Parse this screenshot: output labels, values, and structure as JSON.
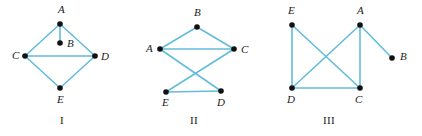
{
  "figure": {
    "background_color": "#ffffff",
    "edge_color": "#63bcdb",
    "vertex_color": "#111111",
    "label_color": "#1a1a1a"
  },
  "graphs": [
    {
      "caption": "I",
      "caption_pos": {
        "x": 62,
        "y": 124
      },
      "vertices": [
        {
          "id": "A",
          "label": "A",
          "x": 60,
          "y": 24,
          "label_x": 58,
          "label_y": 13
        },
        {
          "id": "B",
          "label": "B",
          "x": 60,
          "y": 43,
          "label_x": 67,
          "label_y": 47
        },
        {
          "id": "C",
          "label": "C",
          "x": 25,
          "y": 56,
          "label_x": 12,
          "label_y": 59
        },
        {
          "id": "D",
          "label": "D",
          "x": 95,
          "y": 56,
          "label_x": 101,
          "label_y": 60
        },
        {
          "id": "E",
          "label": "E",
          "x": 60,
          "y": 88,
          "label_x": 57,
          "label_y": 103
        }
      ],
      "edges": [
        {
          "from": "A",
          "to": "B"
        },
        {
          "from": "A",
          "to": "C"
        },
        {
          "from": "A",
          "to": "D"
        },
        {
          "from": "C",
          "to": "D"
        },
        {
          "from": "C",
          "to": "E"
        },
        {
          "from": "D",
          "to": "E"
        }
      ]
    },
    {
      "caption": "II",
      "caption_pos": {
        "x": 194,
        "y": 124
      },
      "vertices": [
        {
          "id": "B",
          "label": "B",
          "x": 197,
          "y": 27,
          "label_x": 194,
          "label_y": 16
        },
        {
          "id": "A",
          "label": "A",
          "x": 160,
          "y": 49,
          "label_x": 146,
          "label_y": 52
        },
        {
          "id": "C",
          "label": "C",
          "x": 234,
          "y": 49,
          "label_x": 241,
          "label_y": 53
        },
        {
          "id": "E",
          "label": "E",
          "x": 166,
          "y": 92,
          "label_x": 162,
          "label_y": 106
        },
        {
          "id": "D",
          "label": "D",
          "x": 221,
          "y": 91,
          "label_x": 217,
          "label_y": 106
        }
      ],
      "edges": [
        {
          "from": "A",
          "to": "B"
        },
        {
          "from": "B",
          "to": "C"
        },
        {
          "from": "A",
          "to": "C"
        },
        {
          "from": "A",
          "to": "D"
        },
        {
          "from": "C",
          "to": "E"
        },
        {
          "from": "E",
          "to": "D"
        }
      ]
    },
    {
      "caption": "III",
      "caption_pos": {
        "x": 329,
        "y": 124
      },
      "vertices": [
        {
          "id": "E",
          "label": "E",
          "x": 292,
          "y": 25,
          "label_x": 288,
          "label_y": 14
        },
        {
          "id": "A",
          "label": "A",
          "x": 360,
          "y": 25,
          "label_x": 357,
          "label_y": 14
        },
        {
          "id": "B",
          "label": "B",
          "x": 392,
          "y": 58,
          "label_x": 400,
          "label_y": 60
        },
        {
          "id": "D",
          "label": "D",
          "x": 292,
          "y": 88,
          "label_x": 287,
          "label_y": 103
        },
        {
          "id": "C",
          "label": "C",
          "x": 360,
          "y": 88,
          "label_x": 355,
          "label_y": 103
        }
      ],
      "edges": [
        {
          "from": "E",
          "to": "D"
        },
        {
          "from": "E",
          "to": "C"
        },
        {
          "from": "A",
          "to": "D"
        },
        {
          "from": "A",
          "to": "C"
        },
        {
          "from": "A",
          "to": "B"
        },
        {
          "from": "D",
          "to": "C"
        }
      ]
    }
  ]
}
